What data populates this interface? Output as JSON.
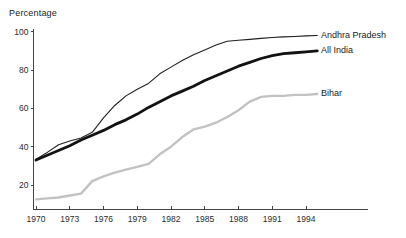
{
  "chart_data": {
    "type": "line",
    "title": "",
    "ylabel": "Percentage",
    "xlabel": "",
    "grid": false,
    "legend_position": "right-of-line-ends",
    "axis_color": "#444444",
    "tick_label_color": "#2b2b2b",
    "x": [
      1970,
      1971,
      1972,
      1973,
      1974,
      1975,
      1976,
      1977,
      1978,
      1979,
      1980,
      1981,
      1982,
      1983,
      1984,
      1985,
      1986,
      1987,
      1988,
      1989,
      1990,
      1991,
      1992,
      1993,
      1994,
      1995
    ],
    "x_ticks": [
      1970,
      1973,
      1976,
      1979,
      1982,
      1985,
      1988,
      1991,
      1994
    ],
    "y_ticks": [
      20,
      40,
      60,
      80,
      100
    ],
    "xlim": [
      1970,
      1999.5
    ],
    "ylim": [
      7,
      101.4
    ],
    "series": [
      {
        "name": "Andhra Pradesh",
        "color": "#1f1f1f",
        "width": 1.1,
        "values": [
          33.5,
          37,
          41,
          43,
          44.5,
          47.5,
          55,
          61.5,
          66.5,
          70,
          73,
          78,
          81.5,
          85,
          88,
          90.5,
          93,
          95,
          95.5,
          96,
          96.5,
          97,
          97.3,
          97.5,
          97.8,
          98
        ]
      },
      {
        "name": "All India",
        "color": "#121212",
        "width": 2.8,
        "values": [
          33,
          35.5,
          38,
          40.5,
          43.5,
          46,
          48.5,
          51.5,
          54,
          57,
          60.5,
          63.5,
          66.5,
          69,
          71.5,
          74.5,
          77,
          79.5,
          82,
          84,
          86,
          87.5,
          88.5,
          89,
          89.5,
          90
        ]
      },
      {
        "name": "Bihar",
        "color": "#c2c2c2",
        "width": 2.4,
        "values": [
          12.5,
          13,
          13.5,
          14.5,
          15.5,
          22,
          24.5,
          26.5,
          28,
          29.5,
          31,
          36,
          40,
          45,
          49,
          50.5,
          52.5,
          55.5,
          59,
          63.5,
          66,
          66.5,
          66.5,
          67,
          67,
          67.5
        ]
      }
    ]
  }
}
